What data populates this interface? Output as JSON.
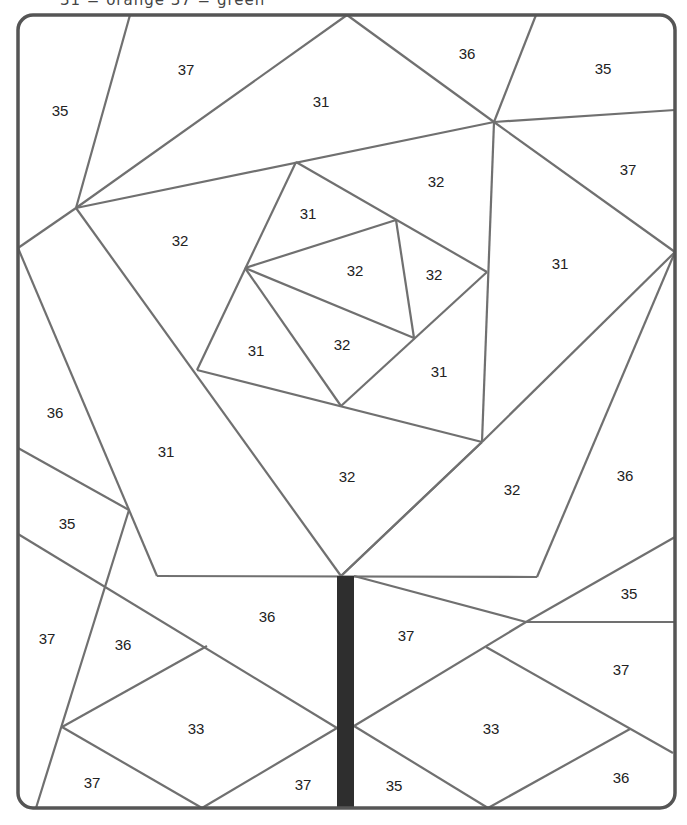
{
  "page": {
    "header_fragment": "31 = orange   37 = green"
  },
  "colors": {
    "line": "#707070",
    "border": "#555555",
    "stem": "#2e2e2e",
    "background": "#ffffff"
  },
  "frame": {
    "x": 18,
    "y": 15,
    "width": 657,
    "height": 793,
    "radius": 15
  },
  "stem": {
    "x": 337,
    "y": 576,
    "width": 17,
    "height": 232
  },
  "lines": [
    [
      [
        130,
        15
      ],
      [
        76,
        208
      ]
    ],
    [
      [
        76,
        208
      ],
      [
        347,
        15
      ]
    ],
    [
      [
        347,
        15
      ],
      [
        494,
        122
      ]
    ],
    [
      [
        536,
        15
      ],
      [
        494,
        122
      ]
    ],
    [
      [
        494,
        122
      ],
      [
        675,
        110
      ]
    ],
    [
      [
        76,
        208
      ],
      [
        494,
        122
      ]
    ],
    [
      [
        494,
        122
      ],
      [
        675,
        252
      ]
    ],
    [
      [
        494,
        122
      ],
      [
        482,
        442
      ]
    ],
    [
      [
        18,
        248
      ],
      [
        76,
        208
      ]
    ],
    [
      [
        76,
        208
      ],
      [
        341,
        576
      ]
    ],
    [
      [
        296,
        162
      ],
      [
        487,
        272
      ]
    ],
    [
      [
        296,
        162
      ],
      [
        197,
        370
      ]
    ],
    [
      [
        245,
        268
      ],
      [
        396,
        220
      ]
    ],
    [
      [
        396,
        220
      ],
      [
        414,
        338
      ]
    ],
    [
      [
        245,
        268
      ],
      [
        414,
        338
      ]
    ],
    [
      [
        245,
        268
      ],
      [
        341,
        406
      ]
    ],
    [
      [
        487,
        272
      ],
      [
        341,
        406
      ]
    ],
    [
      [
        197,
        370
      ],
      [
        482,
        442
      ]
    ],
    [
      [
        482,
        442
      ],
      [
        341,
        576
      ]
    ],
    [
      [
        482,
        442
      ],
      [
        675,
        252
      ]
    ],
    [
      [
        341,
        576
      ],
      [
        482,
        442
      ]
    ],
    [
      [
        675,
        252
      ],
      [
        537,
        577
      ]
    ],
    [
      [
        18,
        248
      ],
      [
        157,
        576
      ]
    ],
    [
      [
        157,
        576
      ],
      [
        537,
        577
      ]
    ],
    [
      [
        18,
        448
      ],
      [
        129,
        510
      ]
    ],
    [
      [
        129,
        510
      ],
      [
        36,
        808
      ]
    ],
    [
      [
        18,
        534
      ],
      [
        337,
        728
      ]
    ],
    [
      [
        207,
        646
      ],
      [
        62,
        727
      ]
    ],
    [
      [
        62,
        727
      ],
      [
        202,
        808
      ]
    ],
    [
      [
        202,
        808
      ],
      [
        337,
        728
      ]
    ],
    [
      [
        354,
        576
      ],
      [
        526,
        622
      ]
    ],
    [
      [
        526,
        622
      ],
      [
        675,
        537
      ]
    ],
    [
      [
        526,
        622
      ],
      [
        675,
        622
      ]
    ],
    [
      [
        526,
        622
      ],
      [
        354,
        726
      ]
    ],
    [
      [
        486,
        647
      ],
      [
        673,
        753
      ]
    ],
    [
      [
        354,
        726
      ],
      [
        488,
        808
      ]
    ],
    [
      [
        488,
        808
      ],
      [
        630,
        729
      ]
    ]
  ],
  "regions": [
    {
      "label": "35",
      "x": 60,
      "y": 112
    },
    {
      "label": "37",
      "x": 186,
      "y": 71
    },
    {
      "label": "31",
      "x": 321,
      "y": 103
    },
    {
      "label": "36",
      "x": 467,
      "y": 55
    },
    {
      "label": "35",
      "x": 603,
      "y": 70
    },
    {
      "label": "32",
      "x": 180,
      "y": 242
    },
    {
      "label": "31",
      "x": 308,
      "y": 215
    },
    {
      "label": "32",
      "x": 436,
      "y": 183
    },
    {
      "label": "37",
      "x": 628,
      "y": 171
    },
    {
      "label": "32",
      "x": 355,
      "y": 272
    },
    {
      "label": "32",
      "x": 434,
      "y": 276
    },
    {
      "label": "31",
      "x": 560,
      "y": 265
    },
    {
      "label": "31",
      "x": 256,
      "y": 352
    },
    {
      "label": "32",
      "x": 342,
      "y": 346
    },
    {
      "label": "31",
      "x": 439,
      "y": 373
    },
    {
      "label": "36",
      "x": 55,
      "y": 414
    },
    {
      "label": "31",
      "x": 166,
      "y": 453
    },
    {
      "label": "32",
      "x": 347,
      "y": 478
    },
    {
      "label": "32",
      "x": 512,
      "y": 491
    },
    {
      "label": "36",
      "x": 625,
      "y": 477
    },
    {
      "label": "35",
      "x": 67,
      "y": 525
    },
    {
      "label": "36",
      "x": 267,
      "y": 618
    },
    {
      "label": "37",
      "x": 47,
      "y": 640
    },
    {
      "label": "36",
      "x": 123,
      "y": 646
    },
    {
      "label": "37",
      "x": 406,
      "y": 637
    },
    {
      "label": "35",
      "x": 629,
      "y": 595
    },
    {
      "label": "37",
      "x": 621,
      "y": 671
    },
    {
      "label": "33",
      "x": 196,
      "y": 730
    },
    {
      "label": "33",
      "x": 491,
      "y": 730
    },
    {
      "label": "37",
      "x": 92,
      "y": 784
    },
    {
      "label": "37",
      "x": 303,
      "y": 786
    },
    {
      "label": "35",
      "x": 394,
      "y": 787
    },
    {
      "label": "36",
      "x": 621,
      "y": 779
    }
  ]
}
